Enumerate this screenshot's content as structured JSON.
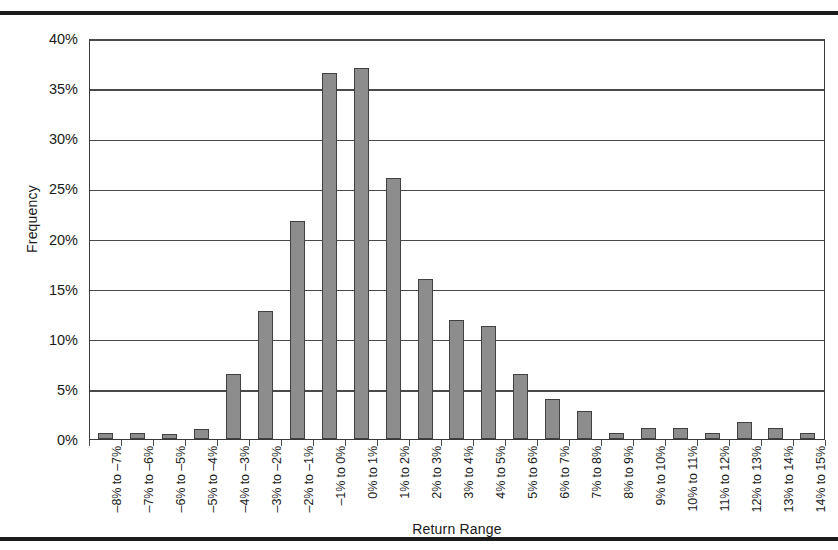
{
  "chart_data": {
    "type": "bar",
    "title": "",
    "xlabel": "Return Range",
    "ylabel": "Frequency",
    "ylim": [
      0,
      40
    ],
    "ytick_values": [
      0,
      5,
      10,
      15,
      20,
      25,
      30,
      35,
      40
    ],
    "ytick_labels": [
      "0%",
      "5%",
      "10%",
      "15%",
      "20%",
      "25%",
      "30%",
      "35%",
      "40%"
    ],
    "grid": "horizontal",
    "legend": "none",
    "bar_color": "#8d8d8d",
    "bar_edge_color": "#404040",
    "categories": [
      "–8% to –7%",
      "–7% to –6%",
      "–6% to –5%",
      "–5% to –4%",
      "–4% to –3%",
      "–3% to –2%",
      "–2% to –1%",
      "–1% to 0%",
      "0% to 1%",
      "1% to 2%",
      "2% to 3%",
      "3% to 4%",
      "4% to 5%",
      "5% to 6%",
      "6% to 7%",
      "7% to 8%",
      "8% to 9%",
      "9% to 10%",
      "10% to 11%",
      "11% to 12%",
      "12% to 13%",
      "13% to 14%",
      "14% to 15%"
    ],
    "values": [
      0.6,
      0.6,
      0.5,
      1.0,
      6.5,
      12.8,
      21.7,
      36.5,
      37.0,
      26.0,
      16.0,
      11.9,
      11.3,
      6.5,
      4.0,
      2.8,
      0.6,
      1.1,
      1.1,
      0.6,
      1.7,
      1.1,
      0.6
    ]
  }
}
